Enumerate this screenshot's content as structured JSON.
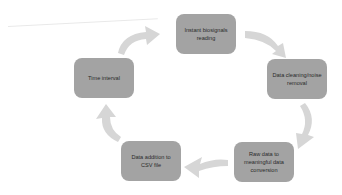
{
  "diagram": {
    "type": "cycle",
    "colors": {
      "node_fill": "#a3a3a3",
      "arrow_fill": "#d6d6d6",
      "text": "#2a2a2a"
    },
    "nodes": [
      {
        "id": "n1",
        "label": "Instant biosignals reading"
      },
      {
        "id": "n2",
        "label": "Data cleaning/noise removal"
      },
      {
        "id": "n3",
        "label": "Raw data to meaningful data conversion"
      },
      {
        "id": "n4",
        "label": "Data addition to CSV file"
      },
      {
        "id": "n5",
        "label": "Time interval"
      }
    ],
    "edges": [
      {
        "from": "n1",
        "to": "n2"
      },
      {
        "from": "n2",
        "to": "n3"
      },
      {
        "from": "n3",
        "to": "n4"
      },
      {
        "from": "n4",
        "to": "n5"
      },
      {
        "from": "n5",
        "to": "n1"
      }
    ]
  }
}
